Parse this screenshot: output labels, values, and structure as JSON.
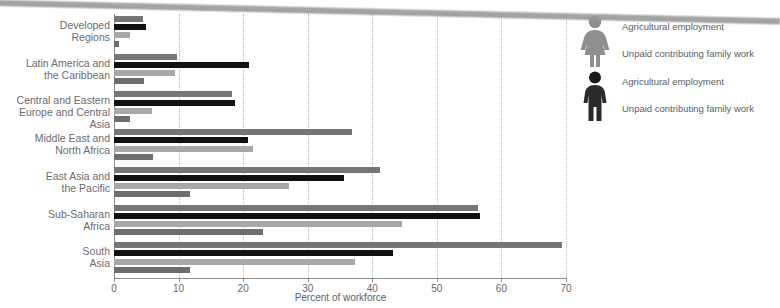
{
  "chart_data": {
    "type": "bar",
    "orientation": "horizontal",
    "title": "",
    "xlabel": "Percent of workforce",
    "ylabel": "",
    "xlim": [
      0,
      70
    ],
    "xticks": [
      0,
      10,
      20,
      30,
      40,
      50,
      60,
      70
    ],
    "xtick_labels": [
      "0",
      "10",
      "20",
      "30",
      "40",
      "50",
      "60",
      "70"
    ],
    "grid": "vertical-dotted",
    "legend_position": "right",
    "categories": [
      "Developed\nRegions",
      "Latin America and\nthe Caribbean",
      "Central and Eastern\nEurope and Central Asia",
      "Middle East and\nNorth Africa",
      "East Asia and\nthe Pacific",
      "Sub-Saharan\nAfrica",
      "South\nAsia"
    ],
    "category_lines": [
      [
        "Developed",
        "Regions"
      ],
      [
        "Latin America and",
        "the Caribbean"
      ],
      [
        "Central and Eastern",
        "Europe and Central Asia"
      ],
      [
        "Middle East and",
        "North Africa"
      ],
      [
        "East Asia and",
        "the Pacific"
      ],
      [
        "Sub-Saharan",
        "Africa"
      ],
      [
        "South",
        "Asia"
      ]
    ],
    "series": [
      {
        "name": "Female — Agricultural employment",
        "color": "#767676",
        "values": [
          4.5,
          9.8,
          18.3,
          36.8,
          41.2,
          56.3,
          69.4
        ]
      },
      {
        "name": "Male — Agricultural employment",
        "color": "#111111",
        "values": [
          5.0,
          20.9,
          18.7,
          20.7,
          35.6,
          56.7,
          43.2
        ]
      },
      {
        "name": "Female — Unpaid contributing family work",
        "color": "#a8a8a8",
        "values": [
          2.5,
          9.5,
          5.9,
          21.5,
          27.1,
          44.6,
          37.3
        ]
      },
      {
        "name": "Male — Unpaid contributing family work",
        "color": "#6e6e6e",
        "values": [
          0.7,
          4.6,
          2.5,
          6.0,
          11.8,
          23.1,
          11.8
        ]
      }
    ]
  },
  "legend": {
    "entries": [
      {
        "icon": "female-figure-icon",
        "label": "Agricultural employment",
        "color": "#909090"
      },
      {
        "icon": "female-figure-icon",
        "label": "Unpaid contributing family work",
        "color": "#909090"
      },
      {
        "icon": "male-figure-icon",
        "label": "Agricultural employment",
        "color": "#1a1a1a"
      },
      {
        "icon": "male-figure-icon",
        "label": "Unpaid contributing family work",
        "color": "#1a1a1a"
      }
    ]
  },
  "axis": {
    "x_title": "Percent of workforce"
  },
  "footer": {
    "text": ""
  }
}
